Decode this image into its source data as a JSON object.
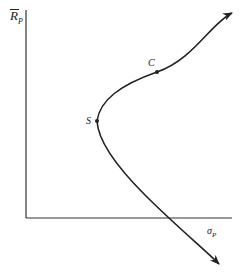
{
  "diagram": {
    "y_axis": {
      "symbol": "R",
      "subscript": "P",
      "overbar": true
    },
    "x_axis": {
      "symbol": "σ",
      "subscript": "P"
    },
    "points": [
      {
        "id": "C",
        "label": "C"
      },
      {
        "id": "S",
        "label": "S"
      }
    ],
    "curve": "hyperbola opening right with arrows at both ends",
    "colors": {
      "line": "#222222",
      "background": "#ffffff"
    }
  }
}
